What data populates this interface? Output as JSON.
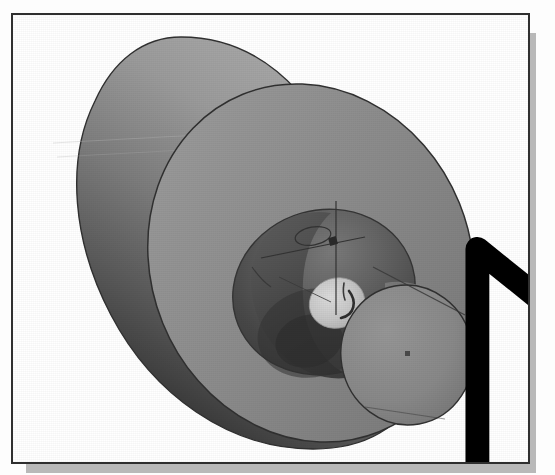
{
  "figure": {
    "caption": "",
    "frame_border_color": "#2f2f2f",
    "shadow_color": "#b9b9b9",
    "background_color": "#ffffff"
  },
  "viewport": {
    "name": "cad-3d-viewport",
    "background_color": "#ffffff",
    "render_mode_label": "Shaded"
  },
  "model": {
    "name": "cylindrical-part",
    "description": "Shaded 3D cylinder with counterbored front face, center bore and offset boss",
    "features": [
      {
        "name": "main-cylinder-body",
        "label": "Cylinder Body",
        "color": "#6b6b6b"
      },
      {
        "name": "front-annular-face",
        "label": "Front Face",
        "color": "#8d8d8d"
      },
      {
        "name": "counterbore-pocket",
        "label": "Counterbore Pocket",
        "color": "#5a5a5a"
      },
      {
        "name": "center-bore-highlight",
        "label": "Center Bore",
        "color": "#c9c9c9"
      },
      {
        "name": "boss-cylinder",
        "label": "Boss Cylinder",
        "color": "#8a8a8a"
      },
      {
        "name": "back-cylinder-face",
        "label": "Back Face",
        "color": "#909090"
      }
    ],
    "sketch": {
      "name": "active-sketch",
      "axis_line_color": "#3a3a3a",
      "circle_color": "#3a3a3a",
      "point_marker_color": "#2a2a2a"
    }
  },
  "colors": {
    "body_highlight": "#a9a9a9",
    "body_midtone": "#6e6e6e",
    "body_shadow": "#2b2b2b",
    "front_face": "#8d8d8d",
    "pocket_dark": "#4f4f4f",
    "pocket_darkest": "#3a3a3a",
    "bore_bright": "#cdcdcd",
    "boss_face": "#888888",
    "outline": "#303030",
    "frame": "#2f2f2f",
    "shadow": "#b9b9b9",
    "cursor_fill": "#ffffff",
    "cursor_stroke": "#000000"
  },
  "cursor": {
    "name": "mouse-pointer",
    "icon": "arrow-pointer-icon",
    "x": 341,
    "y": 219,
    "fill": "#ffffff",
    "stroke": "#000000"
  },
  "direction_glyph": {
    "name": "extrude-direction-indicator",
    "icon": "arrow-up-on-base-icon",
    "label": "Direction",
    "x": 366,
    "y": 240,
    "fill": "#ffffff",
    "stroke": "#000000"
  }
}
